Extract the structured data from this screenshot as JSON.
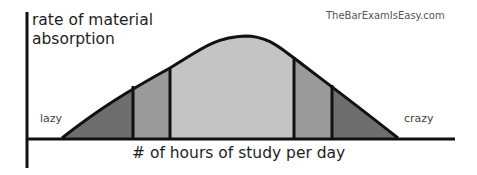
{
  "diagram": {
    "y_axis_label_line1": "rate of material",
    "y_axis_label_line2": "absorption",
    "x_axis_label": "# of hours of study per day",
    "left_end_label": "lazy",
    "right_end_label": "crazy",
    "watermark": "TheBarExamIsEasy.com",
    "regions": [
      {
        "name": "outer-left",
        "color": "#6e6e6e"
      },
      {
        "name": "middle-left",
        "color": "#9a9a9a"
      },
      {
        "name": "center",
        "color": "#c4c4c4"
      },
      {
        "name": "middle-right",
        "color": "#9a9a9a"
      },
      {
        "name": "outer-right",
        "color": "#6e6e6e"
      }
    ],
    "curve_type": "bell curve"
  }
}
